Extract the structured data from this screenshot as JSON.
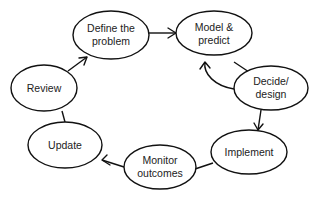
{
  "diagram": {
    "type": "cycle",
    "nodes": [
      {
        "id": "define",
        "lines": [
          "Define the",
          "problem"
        ]
      },
      {
        "id": "model",
        "lines": [
          "Model &",
          "predict"
        ]
      },
      {
        "id": "decide",
        "lines": [
          "Decide/",
          "design"
        ]
      },
      {
        "id": "implement",
        "lines": [
          "Implement"
        ]
      },
      {
        "id": "monitor",
        "lines": [
          "Monitor",
          "outcomes"
        ]
      },
      {
        "id": "update",
        "lines": [
          "Update"
        ]
      },
      {
        "id": "review",
        "lines": [
          "Review"
        ]
      }
    ],
    "edges": [
      {
        "from": "define",
        "to": "model",
        "arrow": true
      },
      {
        "from": "decide",
        "to": "model",
        "arrow": true
      },
      {
        "from": "model",
        "to": "decide",
        "arrow": false
      },
      {
        "from": "decide",
        "to": "implement",
        "arrow": true
      },
      {
        "from": "implement",
        "to": "monitor",
        "arrow": false
      },
      {
        "from": "monitor",
        "to": "update",
        "arrow": true
      },
      {
        "from": "update",
        "to": "review",
        "arrow": false
      },
      {
        "from": "review",
        "to": "define",
        "arrow": true
      }
    ],
    "colors": {
      "stroke": "#111111",
      "fill": "#ffffff",
      "text": "#222222"
    }
  }
}
